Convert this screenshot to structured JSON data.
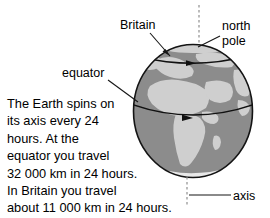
{
  "figure": {
    "title": "The Earth spins on its axis",
    "background_color": "#ffffff"
  },
  "globe": {
    "ocean_color": "#8c8c8c",
    "land_color": "#cfcfcf",
    "outline_color": "#1a1a1a",
    "center_x": 193,
    "center_y": 111,
    "radius_x": 60,
    "radius_y": 67
  },
  "labels": {
    "britain": "Britain",
    "north_pole_line1": "north",
    "north_pole_line2": "pole",
    "equator": "equator",
    "axis": "axis"
  },
  "body_text": {
    "lines": [
      "The Earth spins on",
      "its axis every 24",
      "hours. At the",
      "equator you travel",
      "32 000 km in 24 hours.",
      "In Britain you travel",
      "about 11 000 km in 24 hours."
    ]
  },
  "facts": {
    "rotation_period_hours": 24,
    "equator_distance_km": 32000,
    "britain_distance_km": 11000
  },
  "annotations": {
    "equator_arrow_direction": "east",
    "britain_latitude_arrow_direction": "east",
    "axis_style": "dashed-vertical"
  }
}
